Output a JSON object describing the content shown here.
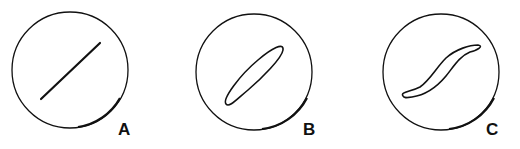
{
  "figure": {
    "panels": [
      {
        "label": "A",
        "description": "straight line"
      },
      {
        "label": "B",
        "description": "narrow ellipse"
      },
      {
        "label": "C",
        "description": "S-shaped loop"
      }
    ],
    "stroke_color": "#111111",
    "background": "#ffffff"
  }
}
